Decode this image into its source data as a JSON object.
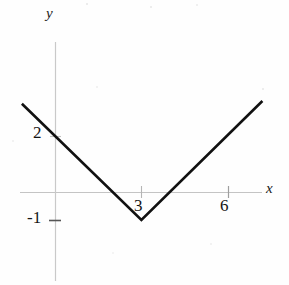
{
  "figure": {
    "title": "",
    "background_color": "#fefefe",
    "width": 289,
    "height": 285
  },
  "axes": {
    "x_axis_label": "x",
    "y_axis_label": "y",
    "axis_color": "#bfbfbf",
    "origin_px": {
      "x": 55,
      "y": 192
    },
    "unit_px": {
      "x": 28.8,
      "y": 28.0
    },
    "x_axis_extent_px": {
      "from": 20,
      "to": 262
    },
    "y_axis_extent_px": {
      "from": 42,
      "to": 281
    },
    "x_ticks": [
      {
        "label": "3",
        "value": 3
      },
      {
        "label": "6",
        "value": 6
      }
    ],
    "y_ticks": [
      {
        "label": "2",
        "value": 2
      },
      {
        "label": "-1",
        "value": -1
      }
    ]
  },
  "chart_data": {
    "type": "line",
    "title": "",
    "xlabel": "x",
    "ylabel": "y",
    "xlim": [
      -1.2,
      7.3
    ],
    "ylim": [
      -1.2,
      3.4
    ],
    "grid": false,
    "legend": null,
    "curve_color": "#111111",
    "curve_width_px": 2.6,
    "function": "y = |x - 3| - 1",
    "series": [
      {
        "name": "y = |x - 3| - 1",
        "x": [
          -1.15,
          3,
          7.2
        ],
        "y": [
          3.15,
          -1,
          3.25
        ]
      }
    ],
    "annotations": [
      {
        "text": "2",
        "x": 0,
        "y": 2,
        "note": "y-intercept label"
      },
      {
        "text": "3",
        "x": 3,
        "y": 0,
        "note": "vertex x-value label"
      },
      {
        "text": "6",
        "x": 6,
        "y": 0,
        "note": "x tick label"
      },
      {
        "text": "-1",
        "x": 0,
        "y": -1,
        "note": "vertex y-value label"
      }
    ],
    "vertex": {
      "x": 3,
      "y": -1
    },
    "x_intercepts": [
      2,
      4
    ],
    "y_intercept": 2
  }
}
